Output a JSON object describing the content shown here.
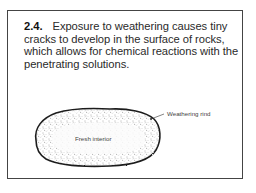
{
  "figure": {
    "number": "2.4.",
    "caption": "Exposure to weathering causes tiny cracks to develop in the surface of rocks, which allows for chemical reactions with the penetrating solutions.",
    "labels": {
      "rind": "Weathering rind",
      "interior": "Fresh interior"
    }
  }
}
